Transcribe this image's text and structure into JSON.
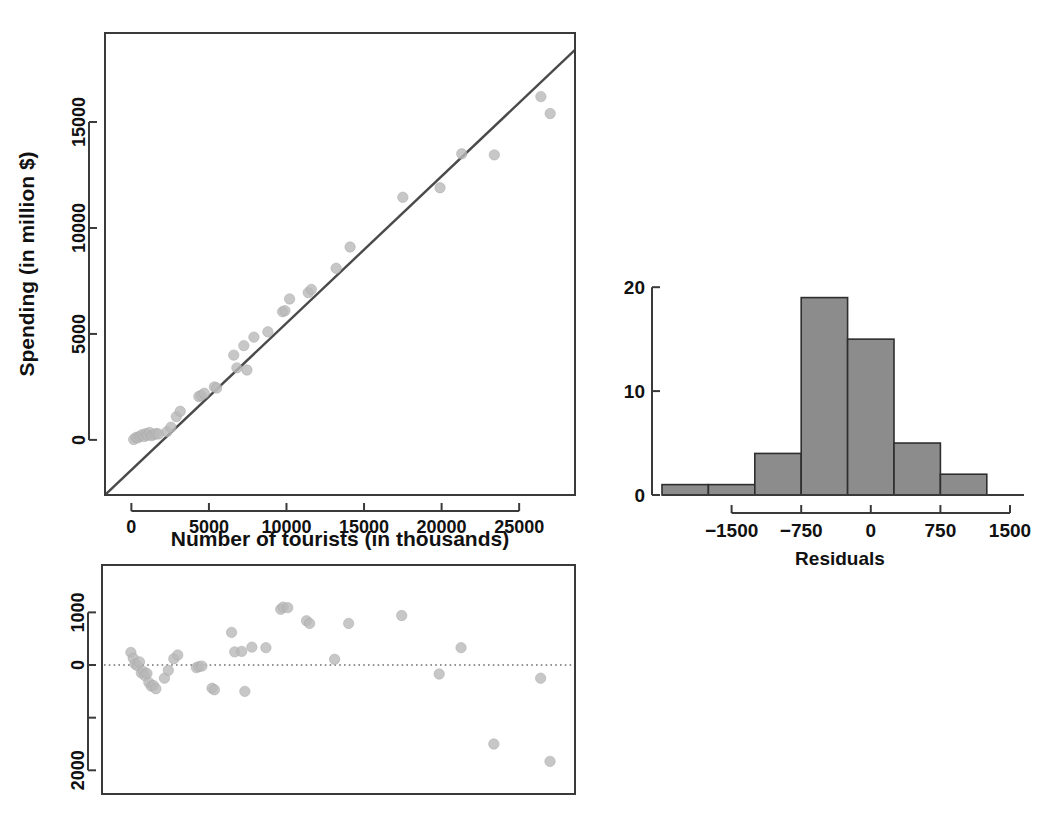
{
  "figure": {
    "title": "",
    "background": "#ffffff",
    "point_color": "#b9b9b9",
    "line_color": "#4a4a4a",
    "bar_fill": "#8c8c8c",
    "bar_stroke": "#2e2e2e"
  },
  "chart_data": [
    {
      "id": "scatter-regression",
      "type": "scatter",
      "title": "",
      "xlabel": "Number of tourists (in thousands)",
      "ylabel": "Spending (in million $)",
      "xlim": [
        -1700,
        28600
      ],
      "ylim": [
        -2600,
        19200
      ],
      "xticks": [
        0,
        5000,
        10000,
        15000,
        20000,
        25000
      ],
      "xtick_labels": [
        "0",
        "5000",
        "10000",
        "15000",
        "20000",
        "25000"
      ],
      "yticks": [
        0,
        5000,
        10000,
        15000
      ],
      "ytick_labels": [
        "0",
        "5000",
        "10000",
        "15000"
      ],
      "grid": false,
      "legend": "none",
      "fit_line": {
        "label": "least-squares regression line",
        "intercept": -1420,
        "slope": 0.693,
        "x_start": -1700,
        "x_end": 28600
      },
      "x": [
        150,
        300,
        420,
        560,
        700,
        820,
        950,
        1050,
        1180,
        1300,
        1450,
        1600,
        1750,
        2300,
        2550,
        2900,
        3150,
        4350,
        4500,
        4700,
        5350,
        5500,
        6600,
        6800,
        7250,
        7450,
        7900,
        8800,
        9750,
        9900,
        10200,
        11400,
        11600,
        13200,
        14100,
        17500,
        19900,
        21300,
        23400,
        26400,
        27000
      ],
      "y": [
        20,
        120,
        100,
        180,
        250,
        160,
        300,
        220,
        350,
        200,
        250,
        300,
        280,
        390,
        600,
        1100,
        1350,
        2050,
        2100,
        2200,
        2500,
        2450,
        4000,
        3400,
        4450,
        3300,
        4850,
        5100,
        6050,
        6100,
        6650,
        6950,
        7100,
        8100,
        9100,
        11450,
        11900,
        13500,
        13450,
        16200,
        15400
      ]
    },
    {
      "id": "residual-plot",
      "type": "scatter",
      "title": "",
      "xlabel": "",
      "ylabel": "",
      "xlim": [
        -1700,
        28600
      ],
      "ylim": [
        -2450,
        1900
      ],
      "xticks": [],
      "xtick_labels": [],
      "yticks": [
        1000,
        0,
        -1000,
        -2000
      ],
      "ytick_labels": [
        "1000",
        "0",
        "",
        "2000"
      ],
      "grid": false,
      "legend": "none",
      "reference_line": {
        "y": 0,
        "style": "dotted"
      },
      "x": [
        150,
        300,
        420,
        560,
        700,
        820,
        950,
        1050,
        1180,
        1300,
        1450,
        1600,
        1750,
        2300,
        2550,
        2900,
        3150,
        4350,
        4500,
        4700,
        5350,
        5500,
        6600,
        6800,
        7250,
        7450,
        7900,
        8800,
        9750,
        9900,
        10200,
        11400,
        11600,
        13200,
        14100,
        17500,
        19900,
        21300,
        23400,
        26400,
        27000
      ],
      "y": [
        240,
        130,
        20,
        -10,
        60,
        -150,
        -120,
        -200,
        -160,
        -330,
        -400,
        -390,
        -450,
        -250,
        -100,
        120,
        190,
        -50,
        -30,
        -20,
        -440,
        -470,
        620,
        250,
        260,
        -500,
        340,
        330,
        1060,
        1100,
        1090,
        840,
        790,
        110,
        790,
        940,
        -170,
        330,
        -1500,
        -250,
        -1830
      ]
    },
    {
      "id": "residual-histogram",
      "type": "bar",
      "title": "",
      "xlabel": "Residuals",
      "ylabel": "",
      "xlim": [
        -2250,
        1500
      ],
      "ylim": [
        0,
        20.5
      ],
      "xticks": [
        -1500,
        -750,
        0,
        750,
        1500
      ],
      "xtick_labels": [
        "−1500",
        "−750",
        "0",
        "750",
        "1500"
      ],
      "yticks": [
        0,
        10,
        20
      ],
      "ytick_labels": [
        "0",
        "10",
        "20"
      ],
      "grid": false,
      "legend": "none",
      "bin_edges": [
        -2250,
        -1750,
        -1250,
        -750,
        -250,
        250,
        750,
        1250,
        1500
      ],
      "bin_edges_used": [
        -2250,
        -1750,
        -1250,
        -750,
        -250,
        250,
        750,
        1250
      ],
      "bin_width": 500,
      "categories": [
        "-2250 to -1750",
        "-1750 to -1250",
        "-1250 to -750",
        "-750 to -250",
        "-250 to 250",
        "250 to 750",
        "750 to 1250"
      ],
      "values": [
        1,
        1,
        4,
        19,
        15,
        5,
        2
      ]
    }
  ]
}
